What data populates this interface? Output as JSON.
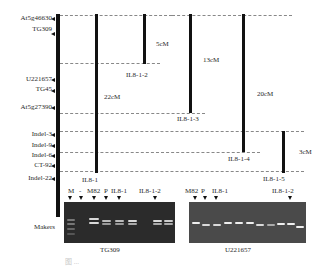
{
  "markers": [
    {
      "label": "At5g46630",
      "y": 15
    },
    {
      "label": "TG309",
      "y": 30
    },
    {
      "label": "U221657",
      "y": 76
    },
    {
      "label": "TG45",
      "y": 87
    },
    {
      "label": "At5g27390",
      "y": 104
    },
    {
      "label": "Indel-3",
      "y": 130
    },
    {
      "label": "Indel-9",
      "y": 141
    },
    {
      "label": "Indel-6",
      "y": 152
    },
    {
      "label": "CT-92",
      "y": 162
    },
    {
      "label": "Indel-22",
      "y": 175
    }
  ],
  "makers_label": "Makers",
  "lines": [
    {
      "name": "IL8-1",
      "label": "IL8-1",
      "distance": "22cM"
    },
    {
      "name": "IL8-1-2",
      "label": "IL8-1-2",
      "distance": "5cM"
    },
    {
      "name": "IL8-1-3",
      "label": "IL8-1-3",
      "distance": "13cM"
    },
    {
      "name": "IL8-1-4",
      "label": "IL8-1-4",
      "distance": "20cM"
    },
    {
      "name": "IL8-1-5",
      "label": "IL8-1-5",
      "distance": "3cM"
    }
  ],
  "gel_left": {
    "lane_labels": [
      "M",
      "-",
      "M82",
      "P",
      "IL8-1",
      "IL8-1-2"
    ],
    "caption": "TG309"
  },
  "gel_right": {
    "lane_labels": [
      "M82",
      "P",
      "IL8-1",
      "IL8-1-2"
    ],
    "caption": "U221657"
  },
  "figure_caption": "图 ..."
}
